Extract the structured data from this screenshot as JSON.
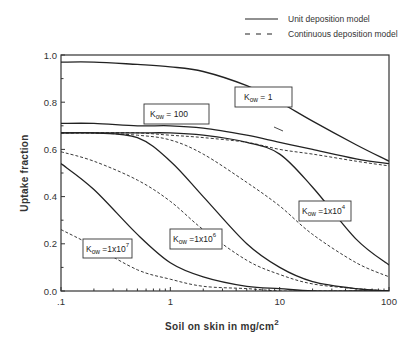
{
  "chart_data": {
    "type": "line",
    "title": "",
    "xlabel": "Soil on skin in mg/cm",
    "xlabel_superscript": "2",
    "ylabel": "Uptake fraction",
    "xscale": "log",
    "xlim": [
      0.1,
      100
    ],
    "ylim": [
      0.0,
      1.0
    ],
    "grid": false,
    "legend_position": "top-right (outside plot)",
    "x_tick_labels": [
      ".1",
      "1",
      "10",
      "100"
    ],
    "x_tick_values": [
      0.1,
      1,
      10,
      100
    ],
    "y_tick_labels": [
      "0.0",
      "0.2",
      "0.4",
      "0.6",
      "0.8",
      "1.0"
    ],
    "y_tick_values": [
      0.0,
      0.2,
      0.4,
      0.6,
      0.8,
      1.0
    ],
    "legend": [
      {
        "label": "Unit deposition model",
        "style": "solid"
      },
      {
        "label": "Continuous deposition model",
        "style": "dashed"
      }
    ],
    "x": [
      0.1,
      0.2,
      0.5,
      1,
      2,
      5,
      10,
      20,
      50,
      100
    ],
    "series": [
      {
        "name": "Kow = 1 (unit)",
        "style": "solid",
        "values": [
          0.97,
          0.97,
          0.96,
          0.95,
          0.93,
          0.87,
          0.8,
          0.72,
          0.62,
          0.55
        ]
      },
      {
        "name": "Kow = 100 (unit)",
        "style": "solid",
        "values": [
          0.71,
          0.71,
          0.7,
          0.7,
          0.69,
          0.66,
          0.63,
          0.6,
          0.56,
          0.54
        ]
      },
      {
        "name": "Kow = 100 (continuous)",
        "style": "dashed",
        "values": [
          0.67,
          0.67,
          0.67,
          0.66,
          0.65,
          0.63,
          0.6,
          0.58,
          0.55,
          0.53
        ]
      },
      {
        "name": "Kow = 1x10^4 (unit)",
        "style": "solid",
        "values": [
          0.67,
          0.67,
          0.67,
          0.67,
          0.66,
          0.63,
          0.58,
          0.44,
          0.22,
          0.11
        ]
      },
      {
        "name": "Kow = 1x10^4 (continuous)",
        "style": "dashed",
        "values": [
          0.67,
          0.67,
          0.66,
          0.64,
          0.58,
          0.46,
          0.36,
          0.24,
          0.12,
          0.06
        ]
      },
      {
        "name": "Kow = 1x10^6 (unit)",
        "style": "solid",
        "values": [
          0.67,
          0.67,
          0.65,
          0.55,
          0.4,
          0.2,
          0.1,
          0.04,
          0.01,
          0.0
        ]
      },
      {
        "name": "Kow = 1x10^6 (continuous)",
        "style": "dashed",
        "values": [
          0.59,
          0.55,
          0.47,
          0.38,
          0.26,
          0.13,
          0.07,
          0.03,
          0.01,
          0.0
        ]
      },
      {
        "name": "Kow = 1x10^7 (unit)",
        "style": "solid",
        "values": [
          0.54,
          0.43,
          0.24,
          0.12,
          0.06,
          0.02,
          0.01,
          0.0,
          0.0,
          0.0
        ]
      },
      {
        "name": "Kow = 1x10^7 (continuous)",
        "style": "dashed",
        "values": [
          0.26,
          0.19,
          0.09,
          0.05,
          0.02,
          0.01,
          0.0,
          0.0,
          0.0,
          0.0
        ]
      }
    ],
    "annotations": [
      {
        "text": "Kow = 1",
        "base": "K",
        "sub": "ow",
        "rest": " = 1"
      },
      {
        "text": "Kow = 100",
        "base": "K",
        "sub": "ow",
        "rest": " = 100"
      },
      {
        "text": "Kow =1x10^4",
        "base": "K",
        "sub": "ow",
        "rest": " =1x10",
        "sup": "4"
      },
      {
        "text": "Kow =1x10^6",
        "base": "K",
        "sub": "ow",
        "rest": " =1x10",
        "sup": "6"
      },
      {
        "text": "Kow =1x10^7",
        "base": "K",
        "sub": "ow",
        "rest": " =1x10",
        "sup": "7"
      }
    ]
  }
}
